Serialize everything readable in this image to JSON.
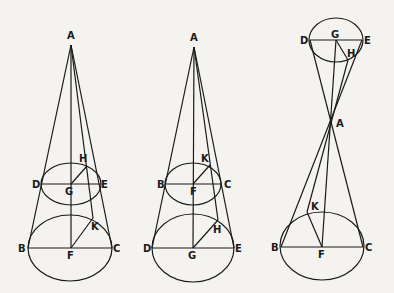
{
  "figures": [
    {
      "id": "cone-1",
      "apex": {
        "label": "A",
        "x": 71,
        "y": 45,
        "lx": 67,
        "ly": 39
      },
      "upper_ellipse": {
        "cx": 71,
        "cy": 184,
        "rx": 30,
        "ry": 21
      },
      "lower_ellipse": {
        "cx": 70,
        "cy": 248,
        "rx": 42,
        "ry": 33
      },
      "points": {
        "D": {
          "label": "D",
          "x": 42,
          "y": 184,
          "lx": 32,
          "ly": 188
        },
        "E": {
          "label": "E",
          "x": 101,
          "y": 184,
          "lx": 101,
          "ly": 188
        },
        "G": {
          "label": "G",
          "x": 71,
          "y": 184,
          "lx": 65,
          "ly": 195
        },
        "H": {
          "label": "H",
          "x": 87,
          "y": 166,
          "lx": 79,
          "ly": 162
        },
        "B": {
          "label": "B",
          "x": 28,
          "y": 248,
          "lx": 18,
          "ly": 252
        },
        "C": {
          "label": "C",
          "x": 112,
          "y": 248,
          "lx": 113,
          "ly": 252
        },
        "F": {
          "label": "F",
          "x": 71,
          "y": 248,
          "lx": 67,
          "ly": 259
        },
        "K": {
          "label": "K",
          "x": 93,
          "y": 218,
          "lx": 91,
          "ly": 230
        }
      }
    },
    {
      "id": "cone-2",
      "apex": {
        "label": "A",
        "x": 194,
        "y": 47,
        "lx": 190,
        "ly": 41
      },
      "upper_ellipse": {
        "cx": 193,
        "cy": 184,
        "rx": 28,
        "ry": 21
      },
      "lower_ellipse": {
        "cx": 193,
        "cy": 248,
        "rx": 41,
        "ry": 34
      },
      "points": {
        "B": {
          "label": "B",
          "x": 165,
          "y": 184,
          "lx": 157,
          "ly": 188
        },
        "C": {
          "label": "C",
          "x": 222,
          "y": 184,
          "lx": 224,
          "ly": 188
        },
        "F": {
          "label": "F",
          "x": 193,
          "y": 184,
          "lx": 190,
          "ly": 195
        },
        "K": {
          "label": "K",
          "x": 210,
          "y": 165,
          "lx": 201,
          "ly": 162
        },
        "D": {
          "label": "D",
          "x": 152,
          "y": 248,
          "lx": 143,
          "ly": 252
        },
        "E": {
          "label": "E",
          "x": 234,
          "y": 248,
          "lx": 235,
          "ly": 252
        },
        "G": {
          "label": "G",
          "x": 193,
          "y": 248,
          "lx": 188,
          "ly": 259
        },
        "H": {
          "label": "H",
          "x": 218,
          "y": 220,
          "lx": 213,
          "ly": 233
        }
      }
    },
    {
      "id": "double-cone-3",
      "apex": {
        "label": "A",
        "x": 332,
        "y": 124,
        "lx": 336,
        "ly": 127
      },
      "upper_ellipse": {
        "cx": 336,
        "cy": 40,
        "rx": 27,
        "ry": 22
      },
      "lower_ellipse": {
        "cx": 322,
        "cy": 246,
        "rx": 42,
        "ry": 34
      },
      "points": {
        "D": {
          "label": "D",
          "x": 310,
          "y": 40,
          "lx": 300,
          "ly": 44
        },
        "E": {
          "label": "E",
          "x": 362,
          "y": 40,
          "lx": 364,
          "ly": 44
        },
        "G": {
          "label": "G",
          "x": 336,
          "y": 40,
          "lx": 331,
          "ly": 38
        },
        "H": {
          "label": "H",
          "x": 348,
          "y": 60,
          "lx": 347,
          "ly": 57
        },
        "B": {
          "label": "B",
          "x": 281,
          "y": 247,
          "lx": 271,
          "ly": 251
        },
        "C": {
          "label": "C",
          "x": 363,
          "y": 247,
          "lx": 365,
          "ly": 251
        },
        "F": {
          "label": "F",
          "x": 322,
          "y": 247,
          "lx": 318,
          "ly": 258
        },
        "K": {
          "label": "K",
          "x": 307,
          "y": 212,
          "lx": 311,
          "ly": 210
        }
      }
    }
  ]
}
